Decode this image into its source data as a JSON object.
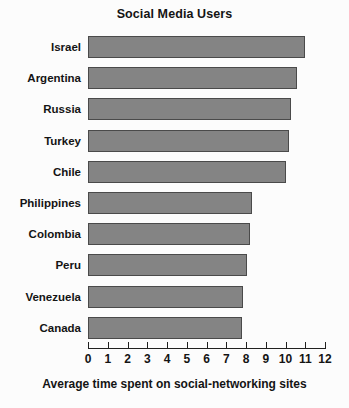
{
  "chart_data": {
    "type": "bar",
    "orientation": "horizontal",
    "title": "Social Media Users",
    "xlabel": "Average time spent on social-networking sites",
    "ylabel": "",
    "xlim": [
      0,
      12
    ],
    "xticks": [
      0,
      1,
      2,
      3,
      4,
      5,
      6,
      7,
      8,
      9,
      10,
      11,
      12
    ],
    "xtick_labels": [
      "0",
      "1",
      "2",
      "3",
      "4",
      "5",
      "6",
      "7",
      "8",
      "9",
      "10",
      "11",
      "12"
    ],
    "grid": false,
    "legend": null,
    "categories": [
      "Israel",
      "Argentina",
      "Russia",
      "Turkey",
      "Chile",
      "Philippines",
      "Colombia",
      "Peru",
      "Venezuela",
      "Canada"
    ],
    "values": [
      11.0,
      10.6,
      10.3,
      10.2,
      10.0,
      8.3,
      8.2,
      8.05,
      7.85,
      7.8
    ],
    "bar_color": "#848484",
    "bar_edge_color": "#4a4a4a",
    "background_color": "#fcfcfc",
    "text_color": "#141414"
  }
}
